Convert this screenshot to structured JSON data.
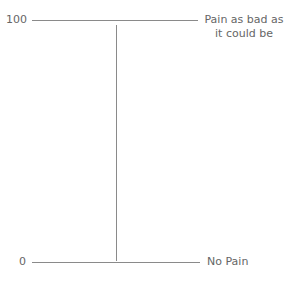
{
  "scale": {
    "top_value": "100",
    "bottom_value": "0",
    "top_anchor_line1": "Pain as bad as",
    "top_anchor_line2": "it could be",
    "bottom_anchor": "No Pain"
  },
  "colors": {
    "line": "#8a8a8a",
    "text": "#666666"
  }
}
